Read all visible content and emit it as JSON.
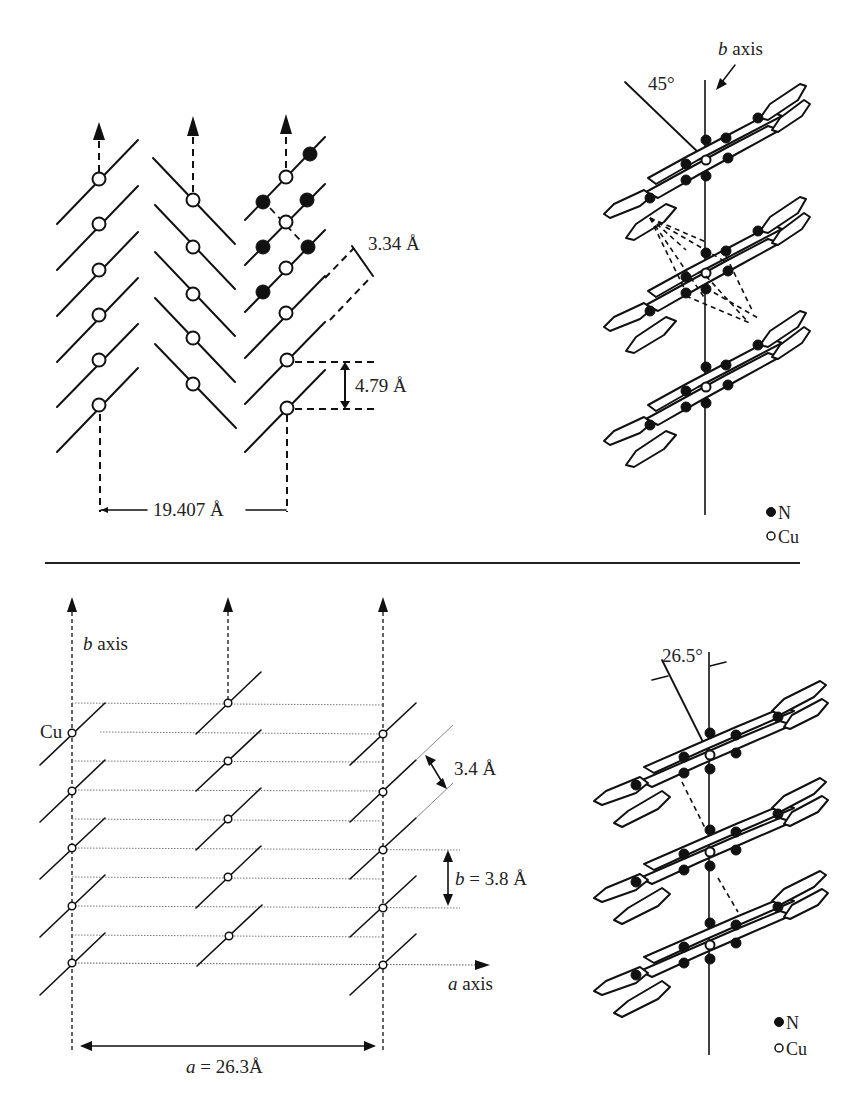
{
  "figure": {
    "top_panel": {
      "left_diagram": {
        "description": "herringbone stacking, side view",
        "labels": {
          "stack_spacing": "3.34 Å",
          "cu_cu_distance": "4.79 Å",
          "column_separation": "19.407 Å"
        }
      },
      "right_diagram": {
        "labels": {
          "axis": "b axis",
          "axis_italic": "b",
          "axis_rest": " axis",
          "tilt_angle": "45°"
        },
        "legend": [
          {
            "symbol": "filled-circle",
            "label": "N"
          },
          {
            "symbol": "open-circle",
            "label": "Cu"
          }
        ]
      }
    },
    "bottom_panel": {
      "left_diagram": {
        "description": "slipped parallel stacking, a-b plane",
        "labels": {
          "b_axis_italic": "b",
          "b_axis_rest": " axis",
          "cu_label": "Cu",
          "stack_spacing": "3.4 Å",
          "b_param_italic": "b",
          "b_param_rest": " = 3.8 Å",
          "a_axis_italic": "a",
          "a_axis_rest": " axis",
          "a_param_italic": "a",
          "a_param_rest": " = 26.3Å"
        }
      },
      "right_diagram": {
        "labels": {
          "tilt_angle": "26.5°"
        },
        "legend": [
          {
            "symbol": "filled-circle",
            "label": "N"
          },
          {
            "symbol": "open-circle",
            "label": "Cu"
          }
        ]
      }
    }
  }
}
